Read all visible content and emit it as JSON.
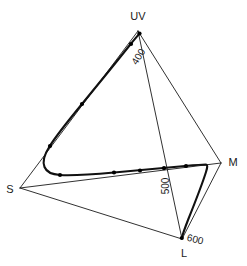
{
  "figure": {
    "name": "tetrahedral-colour-space",
    "background_color": "#ffffff",
    "line_color": "#1a1a1a",
    "locus_color": "#111111"
  },
  "vertices": [
    {
      "key": "UV",
      "label": "UV",
      "x": 138,
      "y": 31,
      "label_x": 138,
      "label_y": 17,
      "anchor": "middle"
    },
    {
      "key": "S",
      "label": "S",
      "x": 20,
      "y": 188,
      "label_x": 10,
      "label_y": 190,
      "anchor": "middle"
    },
    {
      "key": "M",
      "label": "M",
      "x": 221,
      "y": 163,
      "label_x": 233,
      "label_y": 163,
      "anchor": "middle"
    },
    {
      "key": "L",
      "label": "L",
      "x": 182,
      "y": 239,
      "label_x": 184,
      "label_y": 254,
      "anchor": "middle"
    }
  ],
  "wavelength_labels": [
    {
      "text": "400",
      "x": 139,
      "y": 57,
      "rotation": -58
    },
    {
      "text": "500",
      "x": 166,
      "y": 186,
      "rotation": -90
    },
    {
      "text": "600",
      "x": 195,
      "y": 240,
      "rotation": 14
    }
  ],
  "chart_data": {
    "type": "line",
    "title": "",
    "xlabel": "",
    "ylabel": "",
    "axis_vertices": [
      "UV",
      "S",
      "M",
      "L"
    ],
    "tick_labels": [
      "400",
      "500",
      "600"
    ],
    "tick_units": "nm",
    "grid": false,
    "legend": "none",
    "edges": [
      {
        "from": "UV",
        "to": "S",
        "style": "thin"
      },
      {
        "from": "UV",
        "to": "M",
        "style": "thin"
      },
      {
        "from": "UV",
        "to": "L",
        "style": "thin"
      },
      {
        "from": "S",
        "to": "M",
        "style": "thin"
      },
      {
        "from": "S",
        "to": "L",
        "style": "thin"
      },
      {
        "from": "M",
        "to": "L",
        "style": "thin"
      }
    ],
    "locus_path": "M 139.5,33.5 C 137.0,36.5 133.0,41.0 129.5,45.5 C 118.0,60.0 100.0,82.0 82.0,104.0 C 68.0,121.0 56.0,136.0 49.5,146.5 C 44.0,155.0 42.5,162.0 44.5,167.0 C 46.5,172.0 52.0,174.5 60.0,175.0 C 72.0,175.7 92.0,174.5 114.0,172.5 C 140.0,170.2 166.0,167.8 185.0,166.0 C 196.0,165.0 203.0,164.5 206.0,164.5 C 207.5,164.8 207.8,166.5 206.0,172.0 C 203.5,180.0 196.0,200.0 188.0,220.0 C 184.5,229.0 182.5,235.0 181.8,238.0",
    "locus_points": [
      {
        "wavelength": 380,
        "x": 139.5,
        "y": 33.5
      },
      {
        "wavelength": 400,
        "x": 131.0,
        "y": 44.0
      },
      {
        "wavelength": 440,
        "x": 82.0,
        "y": 104.0
      },
      {
        "wavelength": 470,
        "x": 50.0,
        "y": 146.0
      },
      {
        "wavelength": 490,
        "x": 60.0,
        "y": 175.0
      },
      {
        "wavelength": 500,
        "x": 114.0,
        "y": 172.5
      },
      {
        "wavelength": 510,
        "x": 140.0,
        "y": 170.5
      },
      {
        "wavelength": 520,
        "x": 164.0,
        "y": 168.2
      },
      {
        "wavelength": 540,
        "x": 186.0,
        "y": 166.0
      },
      {
        "wavelength": 600,
        "x": 181.8,
        "y": 238.0
      }
    ]
  }
}
